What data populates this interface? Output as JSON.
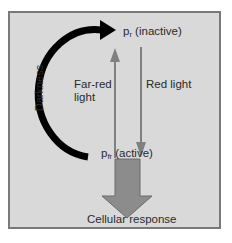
{
  "diagram": {
    "nodes": {
      "inactive": {
        "symbol": "p",
        "subscript": "r",
        "label": "(inactive)"
      },
      "active": {
        "symbol": "p",
        "subscript": "fr",
        "label": "(active)"
      },
      "response": {
        "label": "Cellular response"
      }
    },
    "edges": {
      "darkness": {
        "label": "Darkness",
        "from": "active",
        "to": "inactive"
      },
      "far_red": {
        "label_line1": "Far-red",
        "label_line2": "light",
        "from": "active",
        "to": "inactive"
      },
      "red": {
        "label": "Red light",
        "from": "inactive",
        "to": "active"
      },
      "output": {
        "from": "active",
        "to": "response"
      }
    },
    "colors": {
      "background": "#d9d9d9",
      "border": "#7a7a7a",
      "darkness_arrow": "#000000",
      "light_arrows": "#7f7f7f",
      "response_arrow": "#8c8c8c"
    }
  }
}
